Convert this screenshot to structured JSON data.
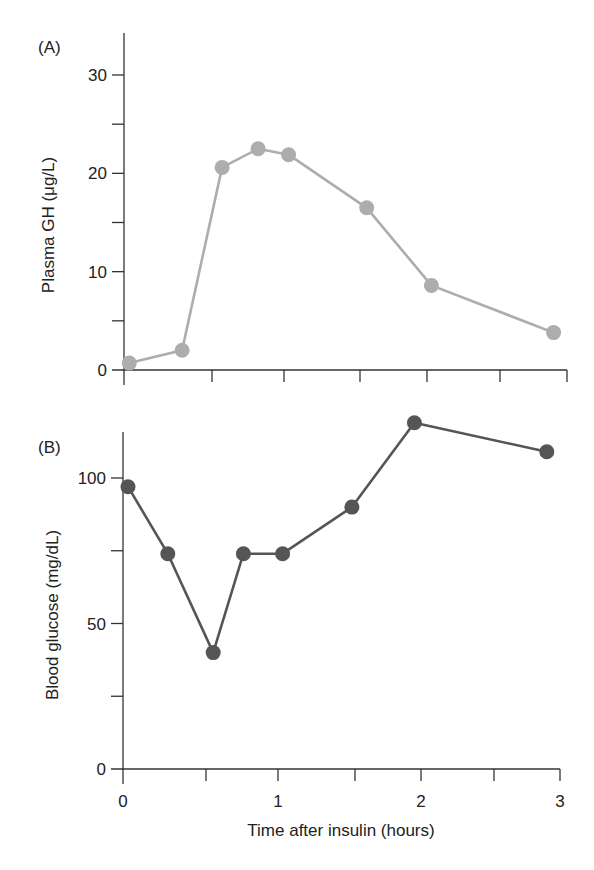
{
  "chart_data": [
    {
      "type": "line",
      "panel_label": "(A)",
      "title": "",
      "xlabel": "",
      "ylabel": "Plasma GH (μg/L)",
      "x_unit": "hours",
      "xlim": [
        0,
        3
      ],
      "ylim": [
        0,
        34
      ],
      "x_ticks": [
        0,
        0.5,
        1,
        1.5,
        2,
        2.5,
        3
      ],
      "x_tick_labels": [],
      "y_ticks": [
        0,
        5,
        10,
        15,
        20,
        25,
        30
      ],
      "y_tick_labels": [
        "0",
        "",
        "10",
        "",
        "20",
        "",
        "30"
      ],
      "grid": false,
      "legend": null,
      "series": [
        {
          "name": "Plasma GH",
          "color": "#adadad",
          "marker": "circle",
          "x": [
            0.03,
            0.33,
            0.57,
            0.82,
            1.03,
            1.55,
            2.03,
            2.9
          ],
          "y": [
            0.7,
            2.0,
            20.6,
            22.5,
            21.9,
            16.5,
            8.6,
            3.8
          ]
        }
      ]
    },
    {
      "type": "line",
      "panel_label": "(B)",
      "title": "",
      "xlabel": "Time after insulin (hours)",
      "ylabel": "Blood glucose (mg/dL)",
      "x_unit": "hours",
      "xlim": [
        0,
        3
      ],
      "ylim": [
        0,
        116
      ],
      "x_ticks": [
        0,
        0.5,
        1,
        1.5,
        2,
        2.5,
        3
      ],
      "x_tick_labels": [
        "0",
        "",
        "1",
        "",
        "2",
        "",
        "3"
      ],
      "y_ticks": [
        0,
        25,
        50,
        75,
        100
      ],
      "y_tick_labels": [
        "0",
        "",
        "50",
        "",
        "100"
      ],
      "grid": false,
      "legend": null,
      "series": [
        {
          "name": "Blood glucose",
          "color": "#555555",
          "marker": "circle",
          "x": [
            0.03,
            0.27,
            0.55,
            0.76,
            1.03,
            1.48,
            1.95,
            2.9
          ],
          "y": [
            97,
            74,
            40,
            74,
            74,
            90,
            119,
            109
          ]
        }
      ]
    }
  ]
}
